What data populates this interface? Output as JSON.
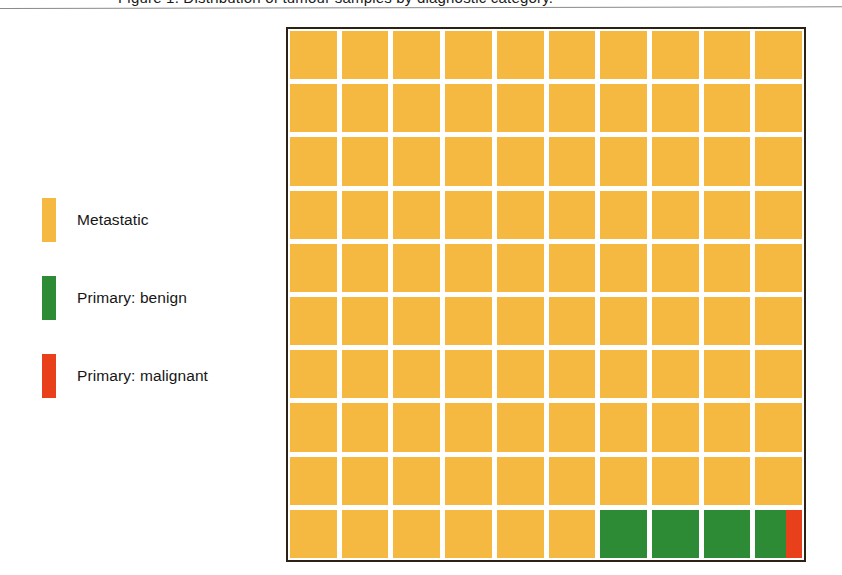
{
  "caption": {
    "text": "Figure 1. Distribution of tumour samples by diagnostic category.",
    "visible_note": "cut-off at top edge"
  },
  "legend": {
    "items": [
      {
        "label": "Metastatic",
        "color": "#F5B942",
        "key": "metastatic"
      },
      {
        "label": "Primary: benign",
        "color": "#2E8B35",
        "key": "primary-benign"
      },
      {
        "label": "Primary: malignant",
        "color": "#E8401A",
        "key": "primary-malignant"
      }
    ]
  },
  "chart_data": {
    "type": "waffle",
    "title": "",
    "xlabel": "",
    "ylabel": "",
    "rows": 10,
    "columns": 10,
    "total_cells": 100,
    "unit": "1 square = 1% of samples",
    "categories": [
      "Metastatic",
      "Primary: benign",
      "Primary: malignant"
    ],
    "colors": [
      "#F5B942",
      "#2E8B35",
      "#E8401A"
    ],
    "values": [
      96.0,
      3.65,
      0.35
    ],
    "legend_position": "left",
    "grid": true,
    "fill_order": "row-major, top-left to bottom-right",
    "cell_fills": [
      "#F5B942",
      "#F5B942",
      "#F5B942",
      "#F5B942",
      "#F5B942",
      "#F5B942",
      "#F5B942",
      "#F5B942",
      "#F5B942",
      "#F5B942",
      "#F5B942",
      "#F5B942",
      "#F5B942",
      "#F5B942",
      "#F5B942",
      "#F5B942",
      "#F5B942",
      "#F5B942",
      "#F5B942",
      "#F5B942",
      "#F5B942",
      "#F5B942",
      "#F5B942",
      "#F5B942",
      "#F5B942",
      "#F5B942",
      "#F5B942",
      "#F5B942",
      "#F5B942",
      "#F5B942",
      "#F5B942",
      "#F5B942",
      "#F5B942",
      "#F5B942",
      "#F5B942",
      "#F5B942",
      "#F5B942",
      "#F5B942",
      "#F5B942",
      "#F5B942",
      "#F5B942",
      "#F5B942",
      "#F5B942",
      "#F5B942",
      "#F5B942",
      "#F5B942",
      "#F5B942",
      "#F5B942",
      "#F5B942",
      "#F5B942",
      "#F5B942",
      "#F5B942",
      "#F5B942",
      "#F5B942",
      "#F5B942",
      "#F5B942",
      "#F5B942",
      "#F5B942",
      "#F5B942",
      "#F5B942",
      "#F5B942",
      "#F5B942",
      "#F5B942",
      "#F5B942",
      "#F5B942",
      "#F5B942",
      "#F5B942",
      "#F5B942",
      "#F5B942",
      "#F5B942",
      "#F5B942",
      "#F5B942",
      "#F5B942",
      "#F5B942",
      "#F5B942",
      "#F5B942",
      "#F5B942",
      "#F5B942",
      "#F5B942",
      "#F5B942",
      "#F5B942",
      "#F5B942",
      "#F5B942",
      "#F5B942",
      "#F5B942",
      "#F5B942",
      "#F5B942",
      "#F5B942",
      "#F5B942",
      "#F5B942",
      "#F5B942",
      "#F5B942",
      "#F5B942",
      "#F5B942",
      "#F5B942",
      "#F5B942",
      "#2E8B35",
      "#2E8B35",
      "#2E8B35",
      "SPLIT"
    ],
    "split_cell": {
      "index": 99,
      "row": 10,
      "column": 10,
      "parts": [
        {
          "color": "#2E8B35",
          "fraction": 0.65
        },
        {
          "color": "#E8401A",
          "fraction": 0.35
        }
      ]
    },
    "gutter_color": "#FFFFFF",
    "border_color": "#2B2115"
  }
}
